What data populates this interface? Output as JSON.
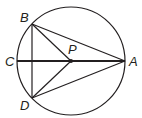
{
  "diagram": {
    "type": "circle-geometry",
    "circle": {
      "cx": 71,
      "cy": 61,
      "r": 54
    },
    "points": [
      {
        "id": "A",
        "label": "A",
        "x": 125,
        "y": 61,
        "lx": 129,
        "ly": 66
      },
      {
        "id": "B",
        "label": "B",
        "x": 32,
        "y": 24,
        "lx": 20,
        "ly": 22
      },
      {
        "id": "C",
        "label": "C",
        "x": 17,
        "y": 61,
        "lx": 5,
        "ly": 66
      },
      {
        "id": "D",
        "label": "D",
        "x": 32,
        "y": 98,
        "lx": 20,
        "ly": 110
      },
      {
        "id": "P",
        "label": "P",
        "x": 71,
        "y": 61,
        "lx": 68,
        "ly": 54
      }
    ],
    "segments": [
      {
        "from": "C",
        "to": "A",
        "weight": "bold"
      },
      {
        "from": "B",
        "to": "D",
        "weight": "normal"
      },
      {
        "from": "B",
        "to": "A",
        "weight": "normal"
      },
      {
        "from": "D",
        "to": "A",
        "weight": "normal"
      },
      {
        "from": "B",
        "to": "P",
        "weight": "normal"
      },
      {
        "from": "D",
        "to": "P",
        "weight": "normal"
      }
    ],
    "colors": {
      "stroke": "#231f20",
      "background": "#ffffff"
    }
  }
}
